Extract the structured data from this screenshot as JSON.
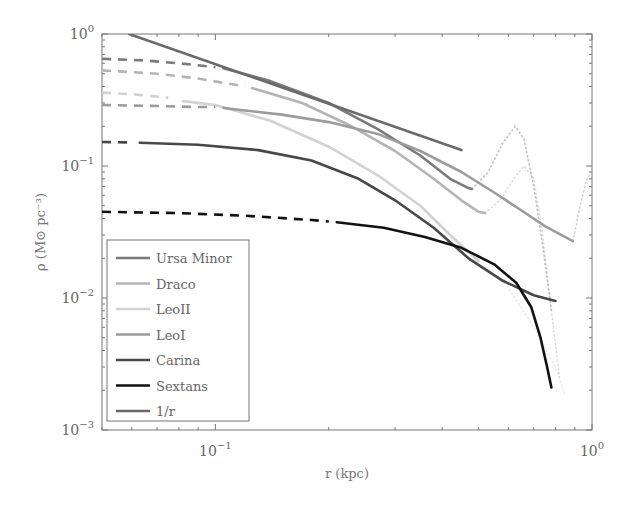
{
  "chart_data": {
    "type": "line",
    "title": "",
    "xlabel": "r (kpc)",
    "ylabel": "ρ (M⊙ pc⁻³)",
    "xscale": "log",
    "yscale": "log",
    "xlim": [
      0.05,
      1.0
    ],
    "ylim": [
      0.001,
      1.0
    ],
    "x_ticks": [
      {
        "value": 0.1,
        "label": "10",
        "exp": "−1"
      },
      {
        "value": 1.0,
        "label": "10",
        "exp": "0"
      }
    ],
    "y_ticks": [
      {
        "value": 1.0,
        "label": "10",
        "exp": "0"
      },
      {
        "value": 0.1,
        "label": "10",
        "exp": "−1"
      },
      {
        "value": 0.01,
        "label": "10",
        "exp": "−2"
      },
      {
        "value": 0.001,
        "label": "10",
        "exp": "−3"
      }
    ],
    "grid": false,
    "legend_position": "lower left",
    "series": [
      {
        "name": "Ursa Minor",
        "color": "#7a7a7a",
        "dashed": [
          [
            0.05,
            0.65
          ],
          [
            0.065,
            0.63
          ],
          [
            0.08,
            0.6
          ],
          [
            0.1,
            0.56
          ]
        ],
        "solid": [
          [
            0.105,
            0.55
          ],
          [
            0.14,
            0.44
          ],
          [
            0.2,
            0.3
          ],
          [
            0.27,
            0.19
          ],
          [
            0.35,
            0.12
          ],
          [
            0.42,
            0.08
          ],
          [
            0.47,
            0.068
          ],
          [
            0.48,
            0.067
          ]
        ],
        "dotted": [
          [
            0.48,
            0.067
          ],
          [
            0.53,
            0.09
          ],
          [
            0.58,
            0.15
          ],
          [
            0.625,
            0.2
          ],
          [
            0.66,
            0.16
          ],
          [
            0.7,
            0.07
          ],
          [
            0.74,
            0.025
          ],
          [
            0.78,
            0.008
          ]
        ]
      },
      {
        "name": "Draco",
        "color": "#b4b4b4",
        "dashed": [
          [
            0.05,
            0.53
          ],
          [
            0.07,
            0.5
          ],
          [
            0.09,
            0.46
          ],
          [
            0.12,
            0.4
          ]
        ],
        "solid": [
          [
            0.125,
            0.39
          ],
          [
            0.17,
            0.3
          ],
          [
            0.23,
            0.2
          ],
          [
            0.3,
            0.13
          ],
          [
            0.38,
            0.08
          ],
          [
            0.45,
            0.055
          ],
          [
            0.5,
            0.045
          ],
          [
            0.52,
            0.044
          ]
        ],
        "dotted": [
          [
            0.52,
            0.044
          ],
          [
            0.57,
            0.055
          ],
          [
            0.62,
            0.08
          ],
          [
            0.66,
            0.1
          ],
          [
            0.7,
            0.08
          ],
          [
            0.74,
            0.03
          ],
          [
            0.78,
            0.008
          ],
          [
            0.82,
            0.0025
          ]
        ]
      },
      {
        "name": "LeoII",
        "color": "#d2d2d2",
        "dashed": [
          [
            0.05,
            0.36
          ],
          [
            0.06,
            0.35
          ],
          [
            0.075,
            0.33
          ]
        ],
        "solid": [
          [
            0.082,
            0.31
          ],
          [
            0.1,
            0.29
          ],
          [
            0.14,
            0.22
          ],
          [
            0.2,
            0.14
          ],
          [
            0.27,
            0.085
          ],
          [
            0.35,
            0.05
          ],
          [
            0.42,
            0.03
          ],
          [
            0.5,
            0.019
          ]
        ],
        "dotted": [
          [
            0.5,
            0.019
          ],
          [
            0.6,
            0.012
          ],
          [
            0.7,
            0.006
          ],
          [
            0.8,
            0.003
          ],
          [
            0.85,
            0.0018
          ]
        ]
      },
      {
        "name": "LeoI",
        "color": "#9c9c9c",
        "dashed": [
          [
            0.05,
            0.29
          ],
          [
            0.07,
            0.285
          ],
          [
            0.09,
            0.28
          ],
          [
            0.1,
            0.28
          ]
        ],
        "solid": [
          [
            0.105,
            0.275
          ],
          [
            0.15,
            0.245
          ],
          [
            0.2,
            0.215
          ],
          [
            0.27,
            0.175
          ],
          [
            0.35,
            0.13
          ],
          [
            0.45,
            0.09
          ],
          [
            0.55,
            0.063
          ],
          [
            0.65,
            0.046
          ],
          [
            0.75,
            0.035
          ],
          [
            0.89,
            0.027
          ]
        ],
        "dotted": [
          [
            0.89,
            0.027
          ],
          [
            0.93,
            0.05
          ],
          [
            0.97,
            0.08
          ],
          [
            1.0,
            0.09
          ]
        ]
      },
      {
        "name": "Carina",
        "color": "#474747",
        "dashed": [
          [
            0.05,
            0.152
          ],
          [
            0.06,
            0.151
          ]
        ],
        "solid": [
          [
            0.063,
            0.15
          ],
          [
            0.09,
            0.145
          ],
          [
            0.13,
            0.132
          ],
          [
            0.18,
            0.11
          ],
          [
            0.24,
            0.08
          ],
          [
            0.3,
            0.055
          ],
          [
            0.38,
            0.034
          ],
          [
            0.47,
            0.02
          ],
          [
            0.58,
            0.0135
          ],
          [
            0.7,
            0.0105
          ],
          [
            0.8,
            0.0095
          ]
        ],
        "dotted": []
      },
      {
        "name": "Sextans",
        "color": "#111111",
        "dashed": [
          [
            0.05,
            0.045
          ],
          [
            0.08,
            0.044
          ],
          [
            0.12,
            0.042
          ],
          [
            0.18,
            0.039
          ],
          [
            0.2,
            0.038
          ]
        ],
        "solid": [
          [
            0.21,
            0.0375
          ],
          [
            0.28,
            0.034
          ],
          [
            0.36,
            0.029
          ],
          [
            0.45,
            0.024
          ],
          [
            0.55,
            0.018
          ],
          [
            0.63,
            0.013
          ],
          [
            0.69,
            0.0085
          ],
          [
            0.73,
            0.005
          ],
          [
            0.76,
            0.003
          ],
          [
            0.78,
            0.0021
          ]
        ],
        "dotted": []
      },
      {
        "name": "1/r",
        "color": "#6a6a6a",
        "dashed": [],
        "solid": [
          [
            0.059,
            1.0
          ],
          [
            0.45,
            0.132
          ]
        ],
        "dotted": []
      }
    ]
  }
}
